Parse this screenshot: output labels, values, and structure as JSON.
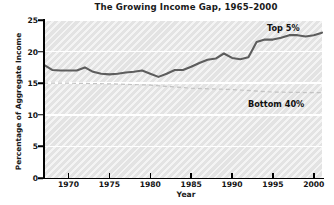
{
  "chart_data": {
    "type": "line",
    "title": "The Growing Income Gap, 1965–2000",
    "xlabel": "Year",
    "ylabel": "Percentage of Aggregate Income",
    "xlim": [
      1967,
      2001
    ],
    "ylim": [
      0,
      25
    ],
    "xticks": [
      1970,
      1975,
      1980,
      1985,
      1990,
      1995,
      2000
    ],
    "yticks": [
      0,
      5,
      10,
      15,
      20,
      25
    ],
    "grid": "horizontal",
    "legend_position": "inline-annotations",
    "series": [
      {
        "name": "Top 5%",
        "style": "solid",
        "color": "#5a5a5a",
        "x": [
          1967,
          1968,
          1969,
          1970,
          1971,
          1972,
          1973,
          1974,
          1975,
          1976,
          1977,
          1978,
          1979,
          1980,
          1981,
          1982,
          1983,
          1984,
          1985,
          1986,
          1987,
          1988,
          1989,
          1990,
          1991,
          1992,
          1993,
          1994,
          1995,
          1996,
          1997,
          1998,
          1999,
          2000,
          2001
        ],
        "values": [
          17.9,
          17.1,
          17.0,
          17.0,
          17.0,
          17.5,
          16.8,
          16.5,
          16.4,
          16.5,
          16.7,
          16.8,
          17.0,
          16.5,
          16.0,
          16.5,
          17.1,
          17.1,
          17.6,
          18.2,
          18.7,
          18.9,
          19.7,
          19.0,
          18.8,
          19.1,
          21.5,
          21.9,
          21.9,
          22.2,
          22.6,
          22.6,
          22.4,
          22.6,
          23.0
        ]
      },
      {
        "name": "Bottom 40%",
        "style": "dashed",
        "color": "#c0c0c0",
        "x": [
          1967,
          1970,
          1975,
          1980,
          1985,
          1990,
          1995,
          2000,
          2001
        ],
        "values": [
          15.0,
          15.0,
          14.9,
          14.7,
          14.2,
          14.0,
          13.6,
          13.5,
          13.5
        ]
      }
    ],
    "annotations": [
      {
        "text": "Top 5%",
        "near_series": "Top 5%"
      },
      {
        "text": "Bottom 40%",
        "near_series": "Bottom 40%"
      }
    ]
  }
}
